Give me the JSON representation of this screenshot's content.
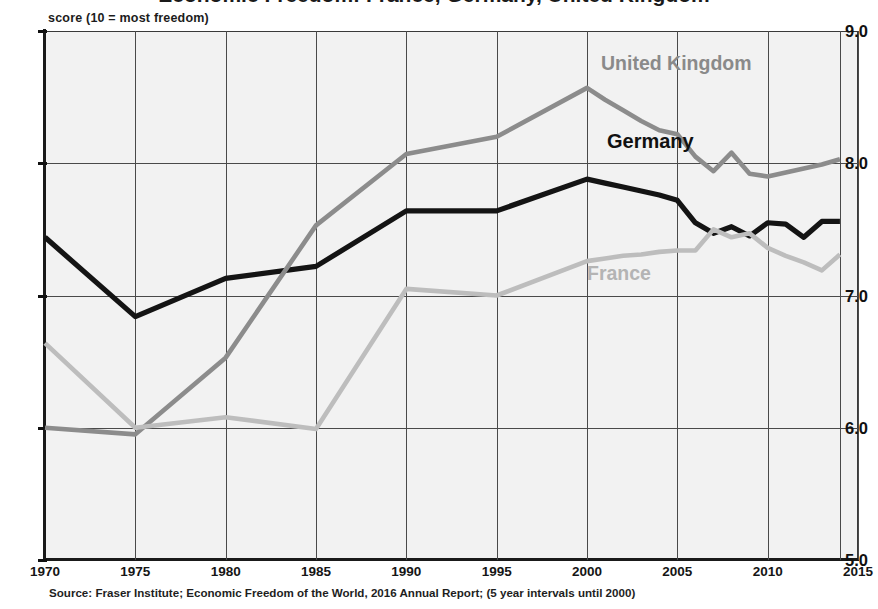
{
  "title": "Economic Freedom: France, Germany, United Kingdom",
  "y_axis_caption": "score (10 = most freedom)",
  "source_note": "Source: Fraser Institute; Economic Freedom of the World, 2016 Annual Report; (5 year intervals until 2000)",
  "y_ticks": [
    "9.0",
    "8.0",
    "7.0",
    "6.0",
    "5.0"
  ],
  "x_ticks": [
    "1970",
    "1975",
    "1980",
    "1985",
    "1990",
    "1995",
    "2000",
    "2005",
    "2010",
    "2015"
  ],
  "series_labels": {
    "united_kingdom": "United Kingdom",
    "germany": "Germany",
    "france": "France"
  },
  "colors": {
    "germany": "#141414",
    "united_kingdom": "#8c8c8c",
    "france": "#bdbdbd",
    "plot_background": "#f2f2f2",
    "grid": "#4a4a4a",
    "axis": "#1a1a1a"
  },
  "chart_data": {
    "type": "line",
    "title": "Economic Freedom: France, Germany, United Kingdom",
    "xlabel": "",
    "ylabel": "score (10 = most freedom)",
    "xlim": [
      1970,
      2015
    ],
    "ylim": [
      5.0,
      9.0
    ],
    "grid": true,
    "legend": "inline-labels",
    "annotations": [
      "5 year intervals until 2000, annual thereafter"
    ],
    "series": [
      {
        "name": "Germany",
        "color": "#141414",
        "x": [
          1970,
          1975,
          1980,
          1985,
          1990,
          1995,
          2000,
          2001,
          2002,
          2003,
          2004,
          2005,
          2006,
          2007,
          2008,
          2009,
          2010,
          2011,
          2012,
          2013,
          2014
        ],
        "values": [
          7.44,
          6.84,
          7.13,
          7.22,
          7.64,
          7.64,
          7.88,
          7.85,
          7.82,
          7.79,
          7.76,
          7.72,
          7.55,
          7.47,
          7.52,
          7.45,
          7.55,
          7.54,
          7.44,
          7.56,
          7.56
        ]
      },
      {
        "name": "United Kingdom",
        "color": "#8c8c8c",
        "x": [
          1970,
          1975,
          1980,
          1985,
          1990,
          1995,
          2000,
          2001,
          2002,
          2003,
          2004,
          2005,
          2006,
          2007,
          2008,
          2009,
          2010,
          2011,
          2012,
          2013,
          2014
        ],
        "values": [
          6.0,
          5.95,
          6.53,
          7.53,
          8.07,
          8.2,
          8.57,
          8.48,
          8.4,
          8.32,
          8.25,
          8.22,
          8.05,
          7.94,
          8.08,
          7.92,
          7.9,
          7.93,
          7.96,
          7.99,
          8.03
        ]
      },
      {
        "name": "France",
        "color": "#bdbdbd",
        "x": [
          1970,
          1975,
          1980,
          1985,
          1990,
          1995,
          2000,
          2001,
          2002,
          2003,
          2004,
          2005,
          2006,
          2007,
          2008,
          2009,
          2010,
          2011,
          2012,
          2013,
          2014
        ],
        "values": [
          6.64,
          6.0,
          6.08,
          5.99,
          7.05,
          7.0,
          7.26,
          7.28,
          7.3,
          7.31,
          7.33,
          7.34,
          7.34,
          7.5,
          7.44,
          7.47,
          7.36,
          7.3,
          7.25,
          7.19,
          7.31
        ]
      }
    ]
  }
}
